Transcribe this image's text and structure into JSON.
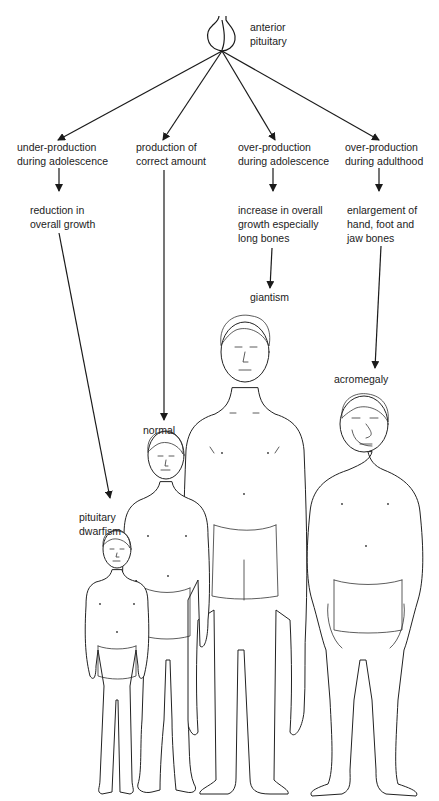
{
  "diagram": {
    "root": {
      "label": "anterior\npituitary",
      "icon": "pituitary-gland-icon"
    },
    "branches": [
      {
        "condition": "under-production\nduring adolescence",
        "effect": "reduction in\noverall growth",
        "result": "pituitary\ndwarfism"
      },
      {
        "condition": "production of\ncorrect amount",
        "effect": "",
        "result": "normal"
      },
      {
        "condition": "over-production\nduring adolescence",
        "effect": "increase in overall\ngrowth especially\nlong bones",
        "result": "giantism"
      },
      {
        "condition": "over-production\nduring adulthood",
        "effect": "enlargement of\nhand, foot and\njaw bones",
        "result": "acromegaly"
      }
    ],
    "colors": {
      "line": "#1a1a1a",
      "background": "#ffffff"
    }
  }
}
